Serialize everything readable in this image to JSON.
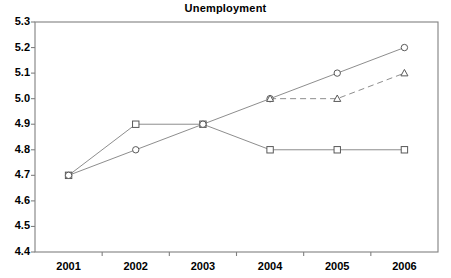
{
  "chart_data": {
    "type": "line",
    "title": "Unemployment",
    "xlabel": "",
    "ylabel": "",
    "categories": [
      "2001",
      "2002",
      "2003",
      "2004",
      "2005",
      "2006"
    ],
    "x": [
      2001,
      2002,
      2003,
      2004,
      2005,
      2006
    ],
    "ylim": [
      4.4,
      5.3
    ],
    "ytick_labels": [
      "5.3",
      "5.2",
      "5.1",
      "5.0",
      "4.9",
      "4.8",
      "4.7",
      "4.6",
      "4.5",
      "4.4"
    ],
    "ytick_values": [
      5.3,
      5.2,
      5.1,
      5.0,
      4.9,
      4.8,
      4.7,
      4.6,
      4.5,
      4.4
    ],
    "ytick_step": 0.1,
    "grid": false,
    "legend": "none",
    "series": [
      {
        "name": "series-square",
        "marker": "square",
        "linestyle": "solid",
        "color": "#808080",
        "values": [
          4.7,
          4.9,
          4.9,
          4.8,
          4.8,
          4.8
        ]
      },
      {
        "name": "series-circle",
        "marker": "circle",
        "linestyle": "solid",
        "color": "#808080",
        "values": [
          4.7,
          4.8,
          4.9,
          5.0,
          5.1,
          5.2
        ]
      },
      {
        "name": "series-triangle",
        "marker": "triangle",
        "linestyle": "dashed",
        "color": "#808080",
        "values": [
          null,
          null,
          null,
          5.0,
          5.0,
          5.1
        ]
      }
    ]
  },
  "style": {
    "axis_color": "#808080",
    "marker_color": "#595959",
    "text_color": "#000000",
    "background": "#ffffff"
  }
}
